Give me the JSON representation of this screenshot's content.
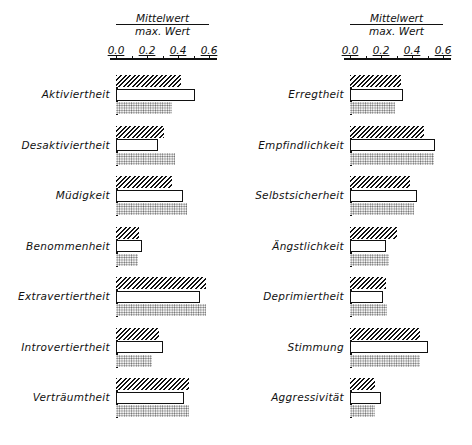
{
  "chart_data": [
    {
      "type": "bar",
      "orientation": "horizontal",
      "title": "",
      "xlabel": "Mittelwert / max. Wert",
      "xlabel_numerator": "Mittelwert",
      "xlabel_denominator": "max. Wert",
      "xlim": [
        0,
        0.6
      ],
      "x_ticks": [
        "0.0",
        "0.2",
        "0.4",
        "0.6"
      ],
      "grid": false,
      "legend": null,
      "series_styles": [
        "hatched",
        "open",
        "dotted"
      ],
      "categories": [
        "Aktiviertheit",
        "Desaktiviertheit",
        "Müdigkeit",
        "Benommenheit",
        "Extravertiertheit",
        "Introvertiertheit",
        "Verträumtheit"
      ],
      "series": [
        {
          "name": "hatched",
          "values": [
            0.42,
            0.31,
            0.36,
            0.15,
            0.58,
            0.28,
            0.47
          ]
        },
        {
          "name": "open",
          "values": [
            0.51,
            0.27,
            0.43,
            0.17,
            0.54,
            0.3,
            0.44
          ]
        },
        {
          "name": "dotted",
          "values": [
            0.36,
            0.38,
            0.46,
            0.14,
            0.58,
            0.23,
            0.47
          ]
        }
      ]
    },
    {
      "type": "bar",
      "orientation": "horizontal",
      "title": "",
      "xlabel": "Mittelwert / max. Wert",
      "xlabel_numerator": "Mittelwert",
      "xlabel_denominator": "max. Wert",
      "xlim": [
        0,
        0.6
      ],
      "x_ticks": [
        "0.0",
        "0.2",
        "0.4",
        "0.6"
      ],
      "grid": false,
      "legend": null,
      "series_styles": [
        "hatched",
        "open",
        "dotted"
      ],
      "categories": [
        "Erregtheit",
        "Empfindlichkeit",
        "Selbstsicherheit",
        "Ängstlichkeit",
        "Deprimiertheit",
        "Stimmung",
        "Aggressivität"
      ],
      "series": [
        {
          "name": "hatched",
          "values": [
            0.33,
            0.48,
            0.39,
            0.3,
            0.23,
            0.45,
            0.16
          ]
        },
        {
          "name": "open",
          "values": [
            0.34,
            0.55,
            0.43,
            0.23,
            0.21,
            0.5,
            0.2
          ]
        },
        {
          "name": "dotted",
          "values": [
            0.29,
            0.54,
            0.41,
            0.25,
            0.24,
            0.45,
            0.16
          ]
        }
      ]
    }
  ]
}
